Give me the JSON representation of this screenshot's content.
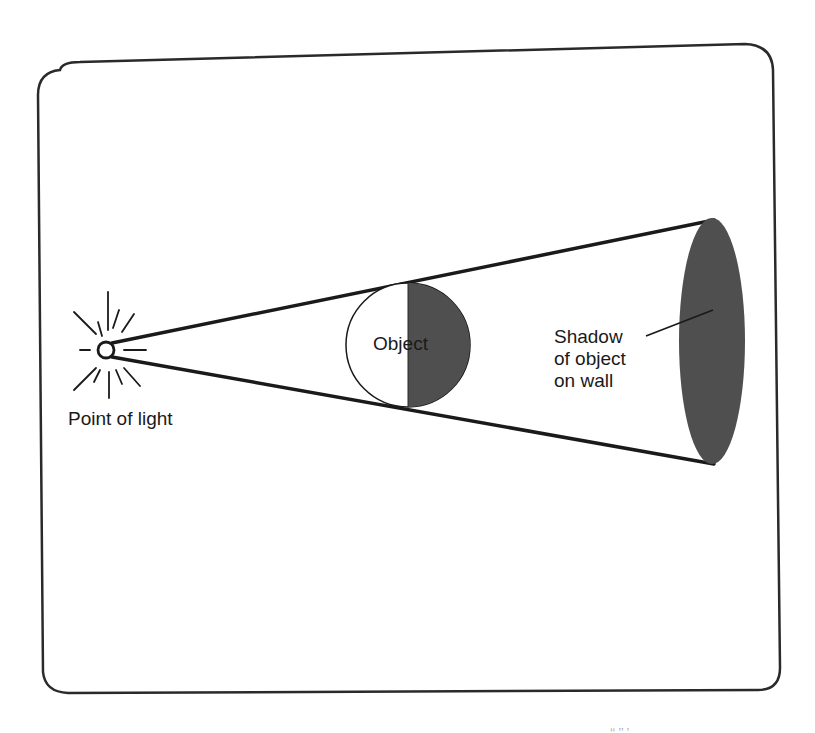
{
  "diagram": {
    "colors": {
      "stroke": "#1a1a1a",
      "shadow_fill": "#4f4f4f",
      "background": "#ffffff",
      "frame": "#2a2a2a"
    },
    "labels": {
      "light_source": "Point of light",
      "object": "Object",
      "shadow_line1": "Shadow",
      "shadow_line2": "of object",
      "shadow_line3": "on wall"
    },
    "elements": {
      "light_source": {
        "cx": 106,
        "cy": 350,
        "r": 8,
        "rays": 12
      },
      "object": {
        "cx": 408,
        "cy": 345,
        "r": 62,
        "shaded_half": "right"
      },
      "shadow": {
        "cx": 712,
        "cy": 341,
        "rx": 33,
        "ry": 123
      },
      "light_cone": {
        "apex": [
          106,
          350
        ],
        "top_end": [
          712,
          220
        ],
        "bottom_end": [
          712,
          464
        ]
      }
    },
    "bottom_fragment": "‘‘ ’’ ’"
  }
}
